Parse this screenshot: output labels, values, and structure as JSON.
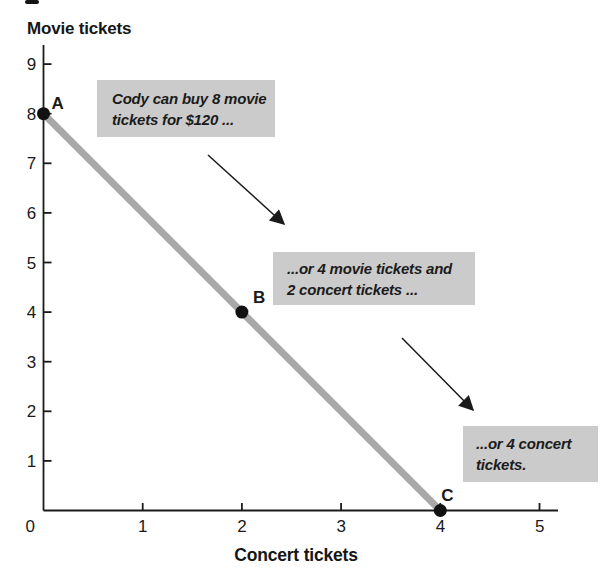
{
  "colors": {
    "callout_bg": "#cbcbcb",
    "budget_line_gray": "#a8a8a8",
    "ink": "#1a1a1a"
  },
  "chart_data": {
    "type": "line",
    "title": "",
    "xlabel": "Concert tickets",
    "ylabel": "Movie tickets",
    "x": [
      0,
      2,
      4
    ],
    "y": [
      8,
      4,
      0
    ],
    "points": [
      {
        "label": "A",
        "x": 0,
        "y": 8
      },
      {
        "label": "B",
        "x": 2,
        "y": 4
      },
      {
        "label": "C",
        "x": 4,
        "y": 0
      }
    ],
    "x_ticks": [
      0,
      1,
      2,
      3,
      4,
      5
    ],
    "y_ticks": [
      1,
      2,
      3,
      4,
      5,
      6,
      7,
      8,
      9
    ],
    "xlim": [
      0,
      5.3
    ],
    "ylim": [
      0,
      9.4
    ],
    "grid": false,
    "legend": false,
    "line_color": "#a8a8a8",
    "point_color": "#111111",
    "annotations": [
      {
        "target": "A",
        "lines": [
          "Cody can buy 8 movie",
          "tickets for $120 ..."
        ]
      },
      {
        "target": "B",
        "lines": [
          "...or 4 movie tickets and",
          "2 concert tickets ..."
        ]
      },
      {
        "target": "C",
        "lines": [
          "...or 4 concert",
          "tickets."
        ]
      }
    ]
  }
}
